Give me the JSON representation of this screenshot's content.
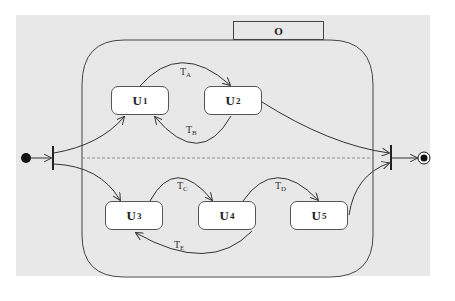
{
  "diagram": {
    "type": "UML state machine (orthogonal composite state with fork/join)",
    "composite_state": {
      "name": "O"
    },
    "regions": [
      {
        "states": [
          {
            "id": "U1",
            "base": "U",
            "sub": "1"
          },
          {
            "id": "U2",
            "base": "U",
            "sub": "2"
          }
        ],
        "transitions": [
          {
            "from": "U1",
            "to": "U2",
            "label_base": "T",
            "label_sub": "A"
          },
          {
            "from": "U2",
            "to": "U1",
            "label_base": "T",
            "label_sub": "B"
          }
        ]
      },
      {
        "states": [
          {
            "id": "U3",
            "base": "U",
            "sub": "3"
          },
          {
            "id": "U4",
            "base": "U",
            "sub": "4"
          },
          {
            "id": "U5",
            "base": "U",
            "sub": "5"
          }
        ],
        "transitions": [
          {
            "from": "U3",
            "to": "U4",
            "label_base": "T",
            "label_sub": "C"
          },
          {
            "from": "U4",
            "to": "U5",
            "label_base": "T",
            "label_sub": "D"
          },
          {
            "from": "U4",
            "to": "U3",
            "label_base": "T",
            "label_sub": "E"
          }
        ]
      }
    ],
    "pseudostates": {
      "initial": "filled-circle",
      "fork": "fork-bar",
      "join": "join-bar",
      "final": "bullseye"
    },
    "edges": [
      {
        "from": "initial",
        "to": "fork"
      },
      {
        "from": "fork",
        "to": "U1"
      },
      {
        "from": "fork",
        "to": "U3"
      },
      {
        "from": "U2",
        "to": "join"
      },
      {
        "from": "U5",
        "to": "join"
      },
      {
        "from": "join",
        "to": "final"
      }
    ]
  }
}
